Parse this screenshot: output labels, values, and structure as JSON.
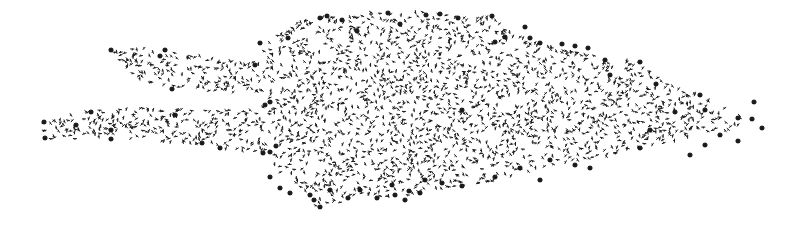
{
  "diagram": {
    "type": "network-graph-layout",
    "background": "#ffffff",
    "node_color": "#1a1a1a",
    "small_node_glyph": "tick-mark",
    "large_node_glyph": "star",
    "regions": [
      {
        "name": "main-body",
        "polygon": [
          [
            262,
            45
          ],
          [
            300,
            20
          ],
          [
            330,
            15
          ],
          [
            390,
            10
          ],
          [
            430,
            12
          ],
          [
            460,
            18
          ],
          [
            490,
            15
          ],
          [
            510,
            30
          ],
          [
            530,
            40
          ],
          [
            560,
            48
          ],
          [
            600,
            55
          ],
          [
            640,
            62
          ],
          [
            660,
            80
          ],
          [
            680,
            88
          ],
          [
            705,
            95
          ],
          [
            720,
            105
          ],
          [
            745,
            112
          ],
          [
            755,
            120
          ],
          [
            735,
            130
          ],
          [
            700,
            135
          ],
          [
            680,
            140
          ],
          [
            640,
            148
          ],
          [
            600,
            158
          ],
          [
            565,
            163
          ],
          [
            540,
            168
          ],
          [
            510,
            178
          ],
          [
            470,
            185
          ],
          [
            430,
            190
          ],
          [
            400,
            198
          ],
          [
            360,
            200
          ],
          [
            330,
            205
          ],
          [
            315,
            210
          ],
          [
            315,
            198
          ],
          [
            300,
            190
          ],
          [
            285,
            178
          ],
          [
            270,
            160
          ],
          [
            262,
            150
          ],
          [
            262,
            105
          ],
          [
            265,
            70
          ]
        ]
      },
      {
        "name": "upper-arm",
        "polygon": [
          [
            110,
            48
          ],
          [
            165,
            48
          ],
          [
            200,
            55
          ],
          [
            230,
            60
          ],
          [
            262,
            62
          ],
          [
            270,
            68
          ],
          [
            270,
            95
          ],
          [
            230,
            92
          ],
          [
            200,
            92
          ],
          [
            172,
            90
          ],
          [
            140,
            80
          ],
          [
            118,
            62
          ]
        ]
      },
      {
        "name": "lower-arm",
        "polygon": [
          [
            42,
            122
          ],
          [
            90,
            110
          ],
          [
            130,
            108
          ],
          [
            180,
            108
          ],
          [
            230,
            108
          ],
          [
            270,
            110
          ],
          [
            275,
            150
          ],
          [
            240,
            152
          ],
          [
            220,
            150
          ],
          [
            200,
            146
          ],
          [
            170,
            142
          ],
          [
            130,
            140
          ],
          [
            90,
            138
          ],
          [
            45,
            140
          ]
        ]
      }
    ],
    "large_nodes": [
      [
        111,
        50
      ],
      [
        165,
        50
      ],
      [
        160,
        56
      ],
      [
        172,
        89
      ],
      [
        44,
        122
      ],
      [
        45,
        138
      ],
      [
        76,
        125
      ],
      [
        91,
        112
      ],
      [
        111,
        130
      ],
      [
        111,
        139
      ],
      [
        175,
        115
      ],
      [
        202,
        143
      ],
      [
        220,
        148
      ],
      [
        263,
        153
      ],
      [
        270,
        152
      ],
      [
        276,
        146
      ],
      [
        270,
        102
      ],
      [
        265,
        105
      ],
      [
        255,
        65
      ],
      [
        260,
        43
      ],
      [
        288,
        38
      ],
      [
        320,
        18
      ],
      [
        327,
        16
      ],
      [
        342,
        20
      ],
      [
        357,
        31
      ],
      [
        388,
        13
      ],
      [
        400,
        24
      ],
      [
        426,
        15
      ],
      [
        440,
        14
      ],
      [
        458,
        18
      ],
      [
        462,
        110
      ],
      [
        492,
        16
      ],
      [
        525,
        27
      ],
      [
        495,
        42
      ],
      [
        505,
        37
      ],
      [
        530,
        38
      ],
      [
        540,
        43
      ],
      [
        562,
        44
      ],
      [
        575,
        46
      ],
      [
        588,
        48
      ],
      [
        605,
        60
      ],
      [
        610,
        75
      ],
      [
        640,
        62
      ],
      [
        700,
        95
      ],
      [
        656,
        84
      ],
      [
        705,
        110
      ],
      [
        705,
        145
      ],
      [
        720,
        135
      ],
      [
        738,
        118
      ],
      [
        752,
        119
      ],
      [
        738,
        141
      ],
      [
        762,
        128
      ],
      [
        754,
        102
      ],
      [
        690,
        155
      ],
      [
        675,
        112
      ],
      [
        640,
        148
      ],
      [
        650,
        130
      ],
      [
        590,
        168
      ],
      [
        575,
        165
      ],
      [
        550,
        160
      ],
      [
        540,
        180
      ],
      [
        520,
        168
      ],
      [
        495,
        177
      ],
      [
        462,
        186
      ],
      [
        442,
        183
      ],
      [
        425,
        180
      ],
      [
        420,
        193
      ],
      [
        395,
        195
      ],
      [
        392,
        185
      ],
      [
        409,
        191
      ],
      [
        405,
        200
      ],
      [
        377,
        198
      ],
      [
        360,
        190
      ],
      [
        348,
        198
      ],
      [
        320,
        207
      ],
      [
        330,
        190
      ],
      [
        270,
        177
      ],
      [
        280,
        188
      ],
      [
        290,
        193
      ],
      [
        310,
        195
      ],
      [
        314,
        200
      ]
    ],
    "seed": 20240613,
    "small_node_count": 2300
  }
}
